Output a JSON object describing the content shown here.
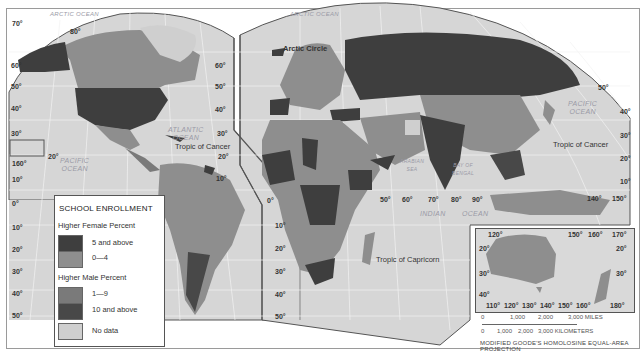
{
  "legend": {
    "title": "SCHOOL ENROLLMENT",
    "groups": [
      {
        "heading": "Higher Female Percent",
        "items": [
          {
            "label": "5 and above",
            "color": "#3e3e3e"
          },
          {
            "label": "0—4",
            "color": "#8e8e8e"
          }
        ]
      },
      {
        "heading": "Higher Male Percent",
        "items": [
          {
            "label": "1—9",
            "color": "#7a7a7a"
          },
          {
            "label": "10 and above",
            "color": "#484848"
          }
        ]
      }
    ],
    "no_data": {
      "label": "No data",
      "color": "#cfcfcf"
    }
  },
  "labels": {
    "arctic_ocean": "ARCTIC OCEAN",
    "arctic_ocean_2": "ARCTIC OCEAN",
    "arctic_circle": "Arctic Circle",
    "atlantic": "ATLANTIC\nOCEAN",
    "pacific_w": "PACIFIC\nOCEAN",
    "pacific_e": "PACIFIC\nOCEAN",
    "indian": "INDIAN",
    "indian_2": "OCEAN",
    "arabian_sea": "ARABIAN\nSEA",
    "bay_of_bengal": "BAY OF\nBENGAL",
    "coral_sea": "CORAL SEA",
    "tropic_cancer_w": "Tropic of Cancer",
    "tropic_cancer_e": "Tropic of Cancer",
    "tropic_capricorn": "Tropic of Capricorn"
  },
  "latitudes_left": [
    "70°",
    "60°",
    "50°",
    "40°",
    "30°",
    "20°",
    "160°",
    "10°",
    "0°",
    "10°",
    "20°",
    "30°",
    "40°",
    "50°",
    "80°"
  ],
  "latitudes_mid": [
    "60°",
    "50°",
    "40°",
    "30°",
    "20°",
    "10°",
    "0°",
    "10°",
    "20°",
    "30°",
    "40°",
    "50°"
  ],
  "latitudes_right": [
    "50°",
    "40°",
    "30°",
    "20°",
    "10°"
  ],
  "longitudes": [
    "50°",
    "60°",
    "70°",
    "80°",
    "90°",
    "140°",
    "150°"
  ],
  "inset": {
    "top_ticks": [
      "120°",
      "150°",
      "160°",
      "170°"
    ],
    "bottom_ticks": [
      "110°",
      "120°",
      "130°",
      "140°",
      "150°",
      "160°",
      "180°"
    ],
    "lat_ticks": [
      "20°",
      "30°",
      "40°"
    ]
  },
  "scale": {
    "miles": [
      "0",
      "1,000",
      "2,000",
      "3,000 MILES"
    ],
    "km": [
      "0",
      "1,000",
      "2,000",
      "3,000 KILOMETERS"
    ]
  },
  "projection": "MODIFIED GOODE'S HOMOLOSINE EQUAL-AREA PROJECTION"
}
